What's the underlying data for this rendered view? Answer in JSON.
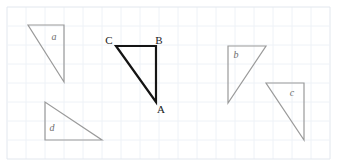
{
  "figure": {
    "canvas": {
      "width": 347,
      "height": 168,
      "background": "#ffffff"
    },
    "grid": {
      "visible": true,
      "spacing": 19,
      "origin_x": 7,
      "origin_y": 7,
      "x_end": 330,
      "y_end": 159,
      "color": "#eef2f7",
      "edge_color": "#e2e7ee"
    },
    "styles": {
      "gray_stroke": "#9a9a9a",
      "gray_stroke_width": 1.2,
      "black_stroke": "#141414",
      "black_stroke_width": 2.2,
      "label_gray": "#6e6e6e",
      "label_black": "#1a1a1a"
    },
    "shapes": [
      {
        "id": "triangle-a",
        "label": "a",
        "style": "gray",
        "label_x": 54,
        "label_y": 40,
        "points": "28,25 64,25 64,82",
        "vertices": [
          {
            "x": 28,
            "y": 25
          },
          {
            "x": 64,
            "y": 25
          },
          {
            "x": 64,
            "y": 82
          }
        ]
      },
      {
        "id": "triangle-d",
        "label": "d",
        "style": "gray",
        "label_x": 52,
        "label_y": 131,
        "points": "45,102 45,140 102,140",
        "vertices": [
          {
            "x": 45,
            "y": 102
          },
          {
            "x": 45,
            "y": 140
          },
          {
            "x": 102,
            "y": 140
          }
        ]
      },
      {
        "id": "triangle-b",
        "label": "b",
        "style": "gray",
        "label_x": 236,
        "label_y": 58,
        "points": "228,46 266,46 228,103",
        "vertices": [
          {
            "x": 228,
            "y": 46
          },
          {
            "x": 266,
            "y": 46
          },
          {
            "x": 228,
            "y": 103
          }
        ]
      },
      {
        "id": "triangle-c",
        "label": "c",
        "style": "gray",
        "label_x": 292,
        "label_y": 96,
        "points": "266,83 304,83 304,140",
        "vertices": [
          {
            "x": 266,
            "y": 83
          },
          {
            "x": 304,
            "y": 83
          },
          {
            "x": 304,
            "y": 140
          }
        ]
      },
      {
        "id": "triangle-abc",
        "label": "",
        "style": "black",
        "points": "116,46 156,46 156,102",
        "vertices": [
          {
            "x": 116,
            "y": 46
          },
          {
            "x": 156,
            "y": 46
          },
          {
            "x": 156,
            "y": 102
          }
        ]
      }
    ],
    "vertex_labels": [
      {
        "id": "label-C",
        "text": "C",
        "x": 109,
        "y": 44,
        "anchor": "middle"
      },
      {
        "id": "label-B",
        "text": "B",
        "x": 159,
        "y": 44,
        "anchor": "middle"
      },
      {
        "id": "label-A",
        "text": "A",
        "x": 161,
        "y": 113,
        "anchor": "middle"
      }
    ]
  }
}
